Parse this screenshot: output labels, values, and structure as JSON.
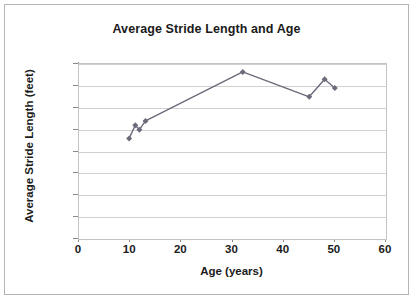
{
  "chart_data": {
    "type": "line",
    "title": "Average Stride Length and Age",
    "xlabel": "Age (years)",
    "ylabel": "Average Stride Length (feet)",
    "xlim": [
      0,
      60
    ],
    "ylim": [
      0,
      4
    ],
    "xticks": [
      "0",
      "10",
      "20",
      "30",
      "40",
      "50",
      "60"
    ],
    "xtick_values": [
      0,
      10,
      20,
      30,
      40,
      50,
      60
    ],
    "yticks": [
      "0",
      "0.5",
      "1",
      "1.5",
      "2",
      "2.5",
      "3",
      "3.5",
      "4"
    ],
    "ytick_values": [
      0,
      0.5,
      1,
      1.5,
      2,
      2.5,
      3,
      3.5,
      4
    ],
    "grid": "horizontal",
    "legend": "none",
    "marker": "diamond",
    "series": [
      {
        "name": "Average Stride Length",
        "color": "#6b6b7a",
        "x": [
          9.8,
          11,
          11.8,
          13,
          32,
          45,
          48,
          50
        ],
        "y": [
          2.3,
          2.6,
          2.5,
          2.7,
          3.82,
          3.25,
          3.65,
          3.45
        ]
      }
    ]
  },
  "colors": {
    "series_line": "#6b6b7a",
    "gridline": "#d0d0d0",
    "axis": "#8a8a8a",
    "text": "#1a1a1a",
    "frame": "#b5b5b5",
    "background": "#ffffff"
  }
}
